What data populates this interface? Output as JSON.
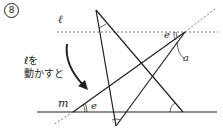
{
  "problem_number": "8",
  "labels": {
    "line_l": "ℓ",
    "line_m": "m",
    "caption_line1": "ℓを",
    "caption_line2": "動かすと",
    "angle_e_top": "e",
    "angle_a": "a",
    "angle_e_bottom": "e"
  },
  "colors": {
    "line": "#231f20",
    "dashed": "#555555"
  }
}
